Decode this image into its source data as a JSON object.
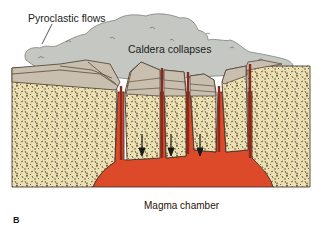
{
  "figure": {
    "panel_label": "B",
    "labels": {
      "pyroclastic_flows": "Pyroclastic flows",
      "caldera_collapses": "Caldera collapses",
      "magma_chamber": "Magma chamber"
    },
    "colors": {
      "ash_cloud": "#c5c8c2",
      "ash_outline": "#7d807a",
      "rock_fill": "#ecdfb2",
      "rock_speckle": "#4a4232",
      "strata_fill": "#c9bfae",
      "strata_line": "#4a3a2e",
      "magma": "#dd4a2a",
      "dike": "#8a2a1e",
      "outline": "#3a2a22"
    },
    "arrows": {
      "count": 3,
      "direction": "down"
    }
  }
}
